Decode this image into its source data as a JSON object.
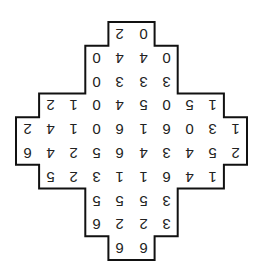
{
  "puzzle": {
    "orientation_degrees": 180,
    "columns": 10,
    "rows_count": 10,
    "rows": [
      {
        "start_col": 4,
        "values": [
          "2",
          "0"
        ]
      },
      {
        "start_col": 3,
        "values": [
          "0",
          "4",
          "4",
          "0"
        ]
      },
      {
        "start_col": 3,
        "values": [
          "0",
          "3",
          "3",
          "3"
        ]
      },
      {
        "start_col": 1,
        "values": [
          "2",
          "1",
          "0",
          "4",
          "5",
          "0",
          "5",
          "1"
        ]
      },
      {
        "start_col": 0,
        "values": [
          "2",
          "4",
          "1",
          "0",
          "6",
          "1",
          "6",
          "0",
          "3",
          "1"
        ]
      },
      {
        "start_col": 0,
        "values": [
          "6",
          "4",
          "2",
          "5",
          "6",
          "4",
          "3",
          "4",
          "5",
          "2"
        ]
      },
      {
        "start_col": 1,
        "values": [
          "5",
          "2",
          "3",
          "1",
          "1",
          "6",
          "4",
          "1"
        ]
      },
      {
        "start_col": 3,
        "values": [
          "5",
          "5",
          "5",
          "3"
        ]
      },
      {
        "start_col": 3,
        "values": [
          "6",
          "2",
          "2",
          "3"
        ]
      },
      {
        "start_col": 4,
        "values": [
          "6",
          "6"
        ]
      }
    ],
    "colors": {
      "border": "#111111",
      "digit": "#222222",
      "background": "#ffffff"
    }
  }
}
